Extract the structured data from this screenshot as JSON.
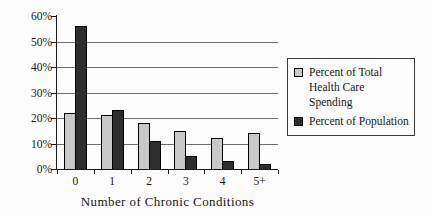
{
  "chart_data": {
    "type": "bar",
    "categories": [
      "0",
      "1",
      "2",
      "3",
      "4",
      "5+"
    ],
    "series": [
      {
        "name": "Percent of Total Health Care Spending",
        "values": [
          22,
          21,
          18,
          15,
          12,
          14
        ],
        "color": "#c9c9c9"
      },
      {
        "name": "Percent of Population",
        "values": [
          56,
          23,
          11,
          5,
          3,
          2
        ],
        "color": "#2e2e2e"
      }
    ],
    "title": "",
    "xlabel": "Number of Chronic Conditions",
    "ylabel": "",
    "ylim": [
      0,
      60
    ],
    "yticks": [
      0,
      10,
      20,
      30,
      40,
      50,
      60
    ],
    "ytick_labels": [
      "0%",
      "10%",
      "20%",
      "30%",
      "40%",
      "50%",
      "60%"
    ],
    "gridlines": [
      10,
      20,
      30,
      40,
      50
    ],
    "grid": "horizontal-only",
    "legend_position": "right",
    "legend_boxed": true
  },
  "colors": {
    "background": "#fdfdfd",
    "axis": "#1a1a1a",
    "gridline": "#6e6e6e",
    "bar_border": "#000000",
    "legend_border": "#3a3a3a",
    "series_spending": "#c9c9c9",
    "series_population": "#2e2e2e"
  }
}
